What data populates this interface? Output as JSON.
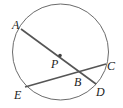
{
  "diagram": {
    "type": "circle-chords",
    "circle": {
      "cx": 60.5,
      "cy": 52,
      "r": 48,
      "stroke": "#6b6b6b"
    },
    "center_label": "P",
    "segments": [
      {
        "name": "AD",
        "from": "A",
        "to": "D",
        "stroke": "#555555"
      },
      {
        "name": "EC",
        "from": "E",
        "to": "C",
        "stroke": "#555555"
      }
    ],
    "points": {
      "A": {
        "x": 21,
        "y": 29
      },
      "D": {
        "x": 96,
        "y": 84
      },
      "E": {
        "x": 25,
        "y": 87
      },
      "C": {
        "x": 106,
        "y": 64
      },
      "B": {
        "x": 78,
        "y": 72
      },
      "P": {
        "x": 60,
        "y": 56
      }
    },
    "labels": [
      {
        "text": "A",
        "x": 12,
        "y": 20
      },
      {
        "text": "P",
        "x": 51,
        "y": 58
      },
      {
        "text": "B",
        "x": 74,
        "y": 76
      },
      {
        "text": "C",
        "x": 107,
        "y": 60
      },
      {
        "text": "D",
        "x": 96,
        "y": 86
      },
      {
        "text": "E",
        "x": 14,
        "y": 89
      }
    ]
  }
}
